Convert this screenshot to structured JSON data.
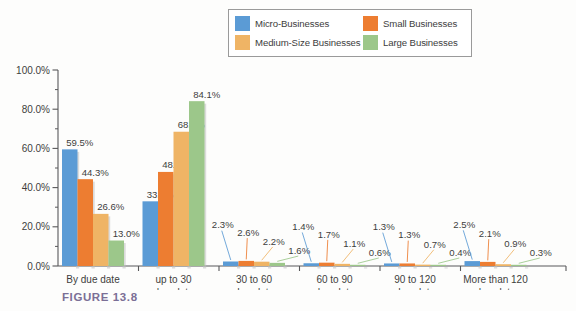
{
  "caption": "FIGURE 13.8",
  "legend": {
    "entries": [
      {
        "label": "Micro-Businesses",
        "color": "#5b9bd5"
      },
      {
        "label": "Small Businesses",
        "color": "#ed7d31"
      },
      {
        "label": "Medium-Size Businesses",
        "color": "#efb465"
      },
      {
        "label": "Large Businesses",
        "color": "#9cc78a"
      }
    ]
  },
  "axis": {
    "y_ticks": [
      "0.0%",
      "20.0%",
      "40.0%",
      "60.0%",
      "80.0%",
      "100.0%"
    ],
    "y_tick_values": [
      0,
      20,
      40,
      60,
      80,
      100
    ],
    "y_minor_step": 10
  },
  "chart_data": {
    "type": "bar",
    "title": "",
    "xlabel": "",
    "ylabel": "",
    "ylim": [
      0,
      100
    ],
    "grid": false,
    "legend_position": "top",
    "categories": [
      "By due date",
      "up to 30 days late",
      "30 to 60 days late",
      "60 to 90 days late",
      "90 to 120 days late",
      "More than 120 days late"
    ],
    "category_lines": [
      [
        "By due date"
      ],
      [
        "up to 30",
        "days late"
      ],
      [
        "30 to 60",
        "days late"
      ],
      [
        "60 to 90",
        "days late"
      ],
      [
        "90 to 120",
        "days late"
      ],
      [
        "More than 120",
        "days late"
      ]
    ],
    "series": [
      {
        "name": "Micro-Businesses",
        "color": "#5b9bd5",
        "values": [
          59.5,
          33.0,
          2.3,
          1.4,
          1.3,
          2.5
        ],
        "labels": [
          "59.5%",
          "33.0%",
          "2.3%",
          "1.4%",
          "1.3%",
          "2.5%"
        ]
      },
      {
        "name": "Small Businesses",
        "color": "#ed7d31",
        "values": [
          44.3,
          48.0,
          2.6,
          1.7,
          1.3,
          2.1
        ],
        "labels": [
          "44.3%",
          "48.0%",
          "2.6%",
          "1.7%",
          "1.3%",
          "2.1%"
        ]
      },
      {
        "name": "Medium-Size Businesses",
        "color": "#efb465",
        "values": [
          26.6,
          68.5,
          2.2,
          1.1,
          0.7,
          0.9
        ],
        "labels": [
          "26.6%",
          "68.5%",
          "2.2%",
          "1.1%",
          "0.7%",
          "0.9%"
        ]
      },
      {
        "name": "Large Businesses",
        "color": "#9cc78a",
        "values": [
          13.0,
          84.1,
          1.6,
          0.6,
          0.4,
          0.3
        ],
        "labels": [
          "13.0%",
          "84.1%",
          "1.6%",
          "0.6%",
          "0.4%",
          "0.3%"
        ]
      }
    ]
  }
}
